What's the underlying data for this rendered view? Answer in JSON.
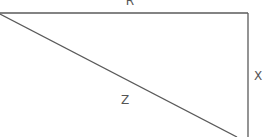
{
  "diagram": {
    "type": "right-triangle",
    "stroke_color": "#5a5a5a",
    "label_color": "#555555",
    "edges": [
      {
        "id": "R",
        "label": "R",
        "from": [
          0,
          13
        ],
        "to": [
          248,
          13
        ],
        "orientation": "horizontal-top"
      },
      {
        "id": "X",
        "label": "X",
        "from": [
          248,
          13
        ],
        "to": [
          248,
          137
        ],
        "orientation": "vertical-right"
      },
      {
        "id": "Z",
        "label": "Z",
        "from": [
          0,
          14
        ],
        "to": [
          237,
          137
        ],
        "orientation": "diagonal-hypotenuse"
      }
    ],
    "labels": {
      "top": "R",
      "right": "X",
      "hypotenuse": "Z"
    }
  }
}
